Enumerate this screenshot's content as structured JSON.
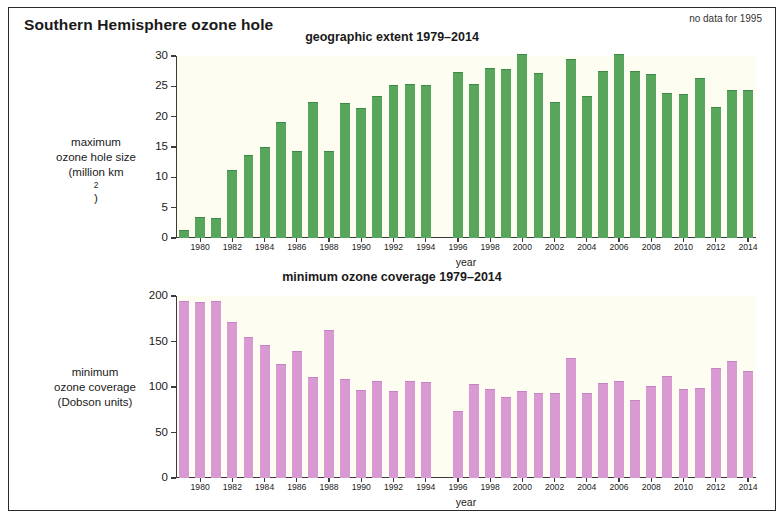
{
  "figure": {
    "title": "Southern Hemisphere ozone hole",
    "note": "no data for 1995"
  },
  "panels": {
    "top": {
      "title": "geographic extent 1979–2014",
      "ylabel_lines": [
        "maximum",
        "ozone hole size",
        "(million km²)"
      ],
      "xlabel": "year"
    },
    "bottom": {
      "title": "minimum ozone coverage 1979–2014",
      "ylabel_lines": [
        "minimum",
        "ozone coverage",
        "(Dobson units)"
      ],
      "xlabel": "year"
    }
  },
  "chart_data": [
    {
      "type": "bar",
      "title": "geographic extent 1979–2014",
      "xlabel": "year",
      "ylabel": "maximum ozone hole size (million km2)",
      "ylim": [
        0,
        30
      ],
      "yticks": [
        0,
        5,
        10,
        15,
        20,
        25,
        30
      ],
      "grid": false,
      "legend": null,
      "bar_color": "#58a55c",
      "annotation": "no data for 1995",
      "categories": [
        1979,
        1980,
        1981,
        1982,
        1983,
        1984,
        1985,
        1986,
        1987,
        1988,
        1989,
        1990,
        1991,
        1992,
        1993,
        1994,
        1995,
        1996,
        1997,
        1998,
        1999,
        2000,
        2001,
        2002,
        2003,
        2004,
        2005,
        2006,
        2007,
        2008,
        2009,
        2010,
        2011,
        2012,
        2013,
        2014
      ],
      "xtick_labels": [
        1980,
        1982,
        1984,
        1986,
        1988,
        1990,
        1992,
        1994,
        1996,
        1998,
        2000,
        2002,
        2004,
        2006,
        2008,
        2010,
        2012,
        2014
      ],
      "values": [
        1.1,
        3.3,
        3.1,
        11.0,
        13.5,
        14.9,
        19.0,
        14.2,
        22.2,
        14.1,
        22.1,
        21.3,
        23.2,
        25.1,
        25.3,
        25.1,
        null,
        27.2,
        25.3,
        27.8,
        27.7,
        30.1,
        27.1,
        22.2,
        29.3,
        23.3,
        27.3,
        30.2,
        27.3,
        26.8,
        23.8,
        23.5,
        26.2,
        21.4,
        24.3,
        24.3
      ]
    },
    {
      "type": "bar",
      "title": "minimum ozone coverage 1979–2014",
      "xlabel": "year",
      "ylabel": "minimum ozone coverage (Dobson units)",
      "ylim": [
        0,
        200
      ],
      "yticks": [
        0,
        50,
        100,
        150,
        200
      ],
      "grid": false,
      "legend": null,
      "bar_color": "#d99ad4",
      "annotation": "no data for 1995",
      "categories": [
        1979,
        1980,
        1981,
        1982,
        1983,
        1984,
        1985,
        1986,
        1987,
        1988,
        1989,
        1990,
        1991,
        1992,
        1993,
        1994,
        1995,
        1996,
        1997,
        1998,
        1999,
        2000,
        2001,
        2002,
        2003,
        2004,
        2005,
        2006,
        2007,
        2008,
        2009,
        2010,
        2011,
        2012,
        2013,
        2014
      ],
      "xtick_labels": [
        1980,
        1982,
        1984,
        1986,
        1988,
        1990,
        1992,
        1994,
        1996,
        1998,
        2000,
        2002,
        2004,
        2006,
        2008,
        2010,
        2012,
        2014
      ],
      "values": [
        193,
        192,
        193,
        170,
        154,
        145,
        124,
        139,
        110,
        162,
        108,
        96,
        106,
        94,
        105,
        104,
        null,
        73,
        102,
        97,
        88,
        94,
        92,
        92,
        131,
        92,
        103,
        105,
        85,
        100,
        111,
        97,
        98,
        120,
        127,
        117,
        115
      ]
    }
  ]
}
